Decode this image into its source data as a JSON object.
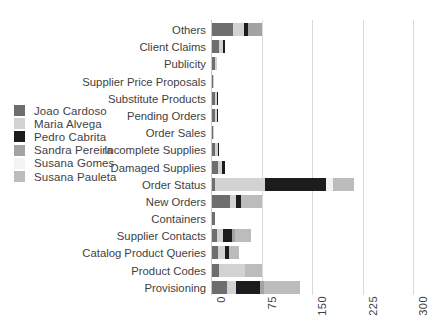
{
  "chart_data": {
    "type": "bar",
    "orientation": "horizontal",
    "stacked": true,
    "title": "",
    "xlabel": "",
    "ylabel": "",
    "xlim": [
      0,
      300
    ],
    "xticks": [
      0,
      75,
      150,
      225,
      300
    ],
    "grid": true,
    "legend_position": "left",
    "categories": [
      "Others",
      "Client Claims",
      "Publicity",
      "Supplier Price Proposals",
      "Substitute Products",
      "Pending Orders",
      "Order Sales",
      "Incomplete Supplies",
      "Damaged Supplies",
      "Order Status",
      "New Orders",
      "Containers",
      "Supplier Contacts",
      "Catalog Product Queries",
      "Product Codes",
      "Provisioning"
    ],
    "series": [
      {
        "name": "Joao Cardoso",
        "color": "#6e6e6e",
        "values": [
          31,
          11,
          4,
          1,
          4,
          4,
          1,
          5,
          9,
          5,
          27,
          4,
          8,
          9,
          11,
          23
        ]
      },
      {
        "name": "Maria Alvega",
        "color": "#d2d2d2",
        "values": [
          16,
          5,
          4,
          1,
          3,
          3,
          1,
          4,
          6,
          73,
          8,
          0,
          9,
          10,
          38,
          13
        ]
      },
      {
        "name": "Pedro Cabrita",
        "color": "#1c1c1c",
        "values": [
          7,
          3,
          0,
          0,
          1,
          1,
          0,
          1,
          4,
          92,
          8,
          0,
          12,
          7,
          0,
          35
        ]
      },
      {
        "name": "Sandra Pereira",
        "color": "#a3a3a3",
        "values": [
          21,
          0,
          0,
          0,
          0,
          0,
          0,
          0,
          0,
          0,
          0,
          0,
          5,
          0,
          0,
          6
        ]
      },
      {
        "name": "Susana Gomes",
        "color": "#f2f2f2",
        "values": [
          0,
          0,
          0,
          0,
          0,
          0,
          0,
          0,
          0,
          10,
          0,
          0,
          0,
          0,
          0,
          0
        ]
      },
      {
        "name": "Susana Pauleta",
        "color": "#bcbcbc",
        "values": [
          0,
          0,
          0,
          0,
          0,
          0,
          0,
          0,
          0,
          31,
          32,
          0,
          24,
          14,
          25,
          53
        ]
      }
    ],
    "totals": [
      75,
      19,
      8,
      2,
      8,
      8,
      2,
      10,
      19,
      211,
      75,
      4,
      58,
      40,
      74,
      130
    ]
  },
  "legend": {
    "items": [
      {
        "label": "Joao Cardoso",
        "color": "#6e6e6e"
      },
      {
        "label": "Maria Alvega",
        "color": "#d2d2d2"
      },
      {
        "label": "Pedro Cabrita",
        "color": "#1c1c1c"
      },
      {
        "label": "Sandra Pereira",
        "color": "#a3a3a3"
      },
      {
        "label": "Susana Gomes",
        "color": "#f4f4f4"
      },
      {
        "label": "Susana Pauleta",
        "color": "#bcbcbc"
      }
    ]
  },
  "colors": {
    "background": "#ffffff",
    "text": "#3f3f3f",
    "gridline": "#d9d9d9",
    "axis": "#c9c9c9"
  }
}
